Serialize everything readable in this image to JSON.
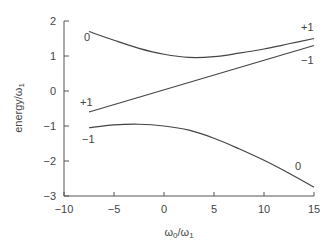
{
  "chart_data": {
    "type": "line",
    "title": "",
    "xlabel": "ω0/ω1",
    "ylabel": "energy/ω1",
    "xlim": [
      -10,
      15
    ],
    "ylim": [
      -3,
      2
    ],
    "xticks": [
      -10,
      -5,
      0,
      5,
      10,
      15
    ],
    "yticks": [
      -3,
      -2,
      -1,
      0,
      1,
      2
    ],
    "grid": false,
    "legend": "none (inline curve labels)",
    "series": [
      {
        "name": "upper level",
        "labels": {
          "left": "0",
          "right": "+1"
        },
        "x": [
          -7.5,
          -5,
          -2.5,
          0,
          2.5,
          5,
          7.5,
          10,
          12.5,
          15
        ],
        "y": [
          1.7,
          1.45,
          1.22,
          1.05,
          0.96,
          0.98,
          1.08,
          1.2,
          1.35,
          1.5
        ]
      },
      {
        "name": "middle level",
        "labels": {
          "left": "+1",
          "right": "-1"
        },
        "x": [
          -7.5,
          15
        ],
        "y": [
          -0.6,
          1.3
        ]
      },
      {
        "name": "lower level",
        "labels": {
          "left": "-1",
          "right": "0"
        },
        "x": [
          -7.5,
          -5,
          -2.5,
          0,
          2.5,
          5,
          7.5,
          10,
          12.5,
          15
        ],
        "y": [
          -1.05,
          -0.97,
          -0.95,
          -1.0,
          -1.12,
          -1.35,
          -1.65,
          -1.98,
          -2.35,
          -2.75
        ]
      }
    ]
  },
  "axes": {
    "x_label_main": "ω",
    "x_label_sub0": "0",
    "x_label_slash": "/ω",
    "x_label_sub1": "1",
    "y_label_main": "energy/ω",
    "y_label_sub": "1",
    "x_tick_labels": [
      "−10",
      "−5",
      "0",
      "5",
      "10",
      "15"
    ],
    "y_tick_labels": [
      "2",
      "1",
      "0",
      "−1",
      "−2",
      "−3"
    ]
  },
  "curve_labels": {
    "upper_left": "0",
    "middle_left": "+1",
    "lower_left": "−1",
    "upper_right": "+1",
    "middle_right": "−1",
    "lower_right": "0"
  }
}
